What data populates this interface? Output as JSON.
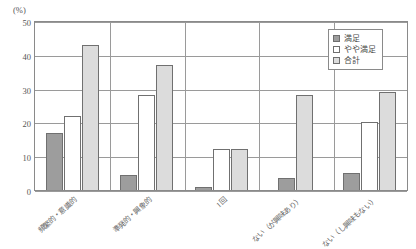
{
  "chart_data": {
    "type": "bar",
    "title": "",
    "xlabel": "",
    "ylabel": "(%)",
    "ylim": [
      0,
      50
    ],
    "yticks": [
      0,
      10,
      20,
      30,
      40,
      50
    ],
    "grid": true,
    "legend_position": "top-right",
    "categories": [
      "頻繁的・意識的",
      "準発的・興象的",
      "1回",
      "ない（が興味あり）",
      "ない（し興味もない）"
    ],
    "series": [
      {
        "name": "満足",
        "color": "#9d9d9d",
        "values": [
          17,
          4.5,
          1,
          3.5,
          5
        ]
      },
      {
        "name": "やや満足",
        "color": "#ffffff",
        "values": [
          22,
          28,
          12,
          0,
          20
        ]
      },
      {
        "name": "合計",
        "color": "#dcdcdc",
        "values": [
          43,
          37,
          12,
          28,
          29
        ]
      }
    ]
  },
  "axis": {
    "unit_label": "(%)",
    "tick_labels": [
      "0",
      "10",
      "20",
      "30",
      "40",
      "50"
    ]
  },
  "legend": {
    "items": [
      {
        "label": "満足"
      },
      {
        "label": "やや満足"
      },
      {
        "label": "合計"
      }
    ]
  }
}
